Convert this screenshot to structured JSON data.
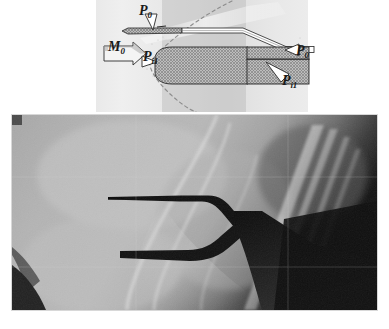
{
  "figure": {
    "kind": "two-panel-technical-figure",
    "caption_fragment": ""
  },
  "schematic": {
    "background_color": "#e7e7e7",
    "labels": [
      {
        "id": "p0-top",
        "var": "P",
        "sub": "0",
        "text": "P0",
        "position": "top-center"
      },
      {
        "id": "m0",
        "var": "M",
        "sub": "0",
        "text": "M0",
        "position": "left"
      },
      {
        "id": "pi1-left",
        "var": "P",
        "sub": "i1",
        "text": "Pi1",
        "position": "center-left"
      },
      {
        "id": "p0-right",
        "var": "P",
        "sub": "0",
        "text": "P0",
        "position": "right-upper"
      },
      {
        "id": "pi1-right",
        "var": "P",
        "sub": "i1",
        "text": "Pi1",
        "position": "right-lower"
      }
    ],
    "flow_arrow": {
      "name": "freestream-mach-arrow",
      "direction": "right",
      "label": "M0"
    },
    "bodies": [
      {
        "name": "thin-pitot-probe",
        "style": "cross-hatched",
        "nose": "sharp-wedge"
      },
      {
        "name": "blunt-pitot-probe",
        "style": "cross-hatched",
        "nose": "rounded"
      }
    ],
    "shock": {
      "name": "detached-bow-shock",
      "style": "dashed",
      "color": "#8c8c8c"
    },
    "leader_lines": {
      "style": "open-triangle-pointer",
      "count": 4
    }
  },
  "photo": {
    "name": "schlieren-photograph",
    "description": "supersonic shock wave pattern over pitot probes",
    "border_color": "#d8d8d8"
  },
  "colors": {
    "hatch": "#8f8f8f",
    "outline": "#2a2a2a",
    "dashed_shock": "#8c8c8c",
    "panel": "#e7e7e7"
  }
}
